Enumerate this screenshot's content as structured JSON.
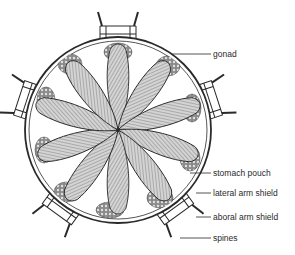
{
  "figure": {
    "labels": [
      {
        "id": "gonad",
        "text": "gonad",
        "x": 213,
        "y": 50,
        "lx1": 172,
        "ly1": 54,
        "lx2": 211,
        "ly2": 54
      },
      {
        "id": "stomach-pouch",
        "text": "stomach pouch",
        "x": 213,
        "y": 169,
        "lx1": 190,
        "ly1": 173,
        "lx2": 211,
        "ly2": 173
      },
      {
        "id": "lateral-arm-shield",
        "text": "lateral arm shield",
        "x": 213,
        "y": 190,
        "lx1": 196,
        "ly1": 193,
        "lx2": 211,
        "ly2": 193
      },
      {
        "id": "aboral-arm-shield",
        "text": "aboral arm shield",
        "x": 213,
        "y": 213,
        "lx1": 196,
        "ly1": 217,
        "lx2": 211,
        "ly2": 217
      },
      {
        "id": "spines",
        "text": "spines",
        "x": 213,
        "y": 234,
        "lx1": 180,
        "ly1": 238,
        "lx2": 211,
        "ly2": 238
      }
    ],
    "colors": {
      "ink": "#2a2a2a",
      "pouch_fill": "#bdbdbd",
      "gonad_fill": "#7a7a7a",
      "background": "#ffffff"
    }
  }
}
